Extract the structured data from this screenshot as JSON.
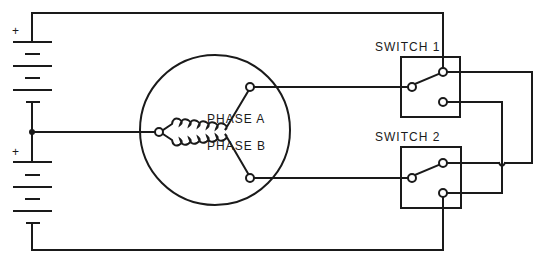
{
  "diagram": {
    "labels": {
      "battery_top_polarity": "+",
      "battery_bottom_polarity": "+",
      "phase_a": "PHASE A",
      "phase_b": "PHASE B",
      "switch_1": "SWITCH 1",
      "switch_2": "SWITCH 2"
    },
    "components": [
      {
        "id": "battery-1",
        "type": "battery",
        "cells": 3
      },
      {
        "id": "battery-2",
        "type": "battery",
        "cells": 3
      },
      {
        "id": "motor",
        "type": "two-phase-motor",
        "windings": [
          "PHASE A",
          "PHASE B"
        ]
      },
      {
        "id": "switch-1",
        "type": "SPDT switch"
      },
      {
        "id": "switch-2",
        "type": "SPDT switch"
      }
    ],
    "colors": {
      "line": "#1a1a1a",
      "background": "#ffffff"
    }
  }
}
